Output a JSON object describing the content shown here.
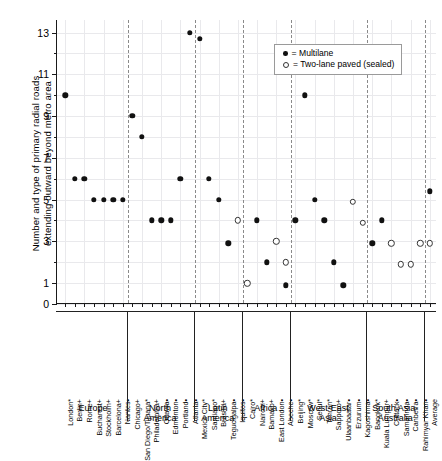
{
  "axis": {
    "ylabel": "Number and type of primary radial roads\nextending outward beyond metro area",
    "ytick_labels": [
      "13",
      "11",
      "9",
      "7",
      "5",
      "3",
      "1",
      "0"
    ],
    "ytick_values": [
      13,
      11,
      9,
      7,
      5,
      3,
      1,
      0
    ],
    "ylim": [
      0,
      13.6
    ]
  },
  "legend": {
    "entries": [
      {
        "marker": "filled-dot",
        "label": "= Multilane"
      },
      {
        "marker": "open-circle",
        "label": "= Two-lane paved (sealed)"
      }
    ]
  },
  "groups": [
    {
      "name": "Europe",
      "label": "Europe"
    },
    {
      "name": "North America",
      "label": "North\nAmerica"
    },
    {
      "name": "Latin America",
      "label": "Latin\nAmerica"
    },
    {
      "name": "Africa",
      "label": "Africa"
    },
    {
      "name": "West-East Asia",
      "label": "West-East\nAsia"
    },
    {
      "name": "South Asia-Australia",
      "label": "South Asia-\nAustralia"
    },
    {
      "name": "Average",
      "label": ""
    }
  ],
  "chart_data": {
    "type": "scatter",
    "title": "",
    "xlabel": "",
    "ylabel": "Number and type of primary radial roads extending outward beyond metro area",
    "ylim": [
      0,
      13.6
    ],
    "grid": true,
    "legend_position": "top-right",
    "categories": [
      "London*",
      "Berlin+",
      "Rome+",
      "Bucharest+",
      "Stockholm+",
      "Barcelona+",
      "Nantes•",
      "Chicago+",
      "San Diego/Tijuana*",
      "Philadelphia+",
      "Ottawa•",
      "Edmonton•",
      "Portland•",
      "Atlanta•",
      "Mexico City*",
      "Santiago*",
      "Brasilia+",
      "Tegucigalpa•",
      "Iquitos•",
      "Cairo*",
      "Nairobi+",
      "Bamako+",
      "East London•",
      "Abeche•",
      "Beijing*",
      "Moscow*",
      "Seoul*",
      "Tehran*",
      "Sapporo+",
      "Ulaanbaatar•",
      "Erzurum•",
      "Kagoshima•",
      "Bangkok*",
      "Kuala Lumpur+",
      "Cuttack•",
      "Samarinda•",
      "Canberra•",
      "Rahimyar Khan•",
      "Average"
    ],
    "series": [
      {
        "name": "Multilane",
        "marker": "filled-dot",
        "points": [
          {
            "city": "London*",
            "value": 10
          },
          {
            "city": "Berlin+",
            "value": 6
          },
          {
            "city": "Rome+",
            "value": 6
          },
          {
            "city": "Bucharest+",
            "value": 5
          },
          {
            "city": "Stockholm+",
            "value": 5
          },
          {
            "city": "Barcelona+",
            "value": 5
          },
          {
            "city": "Nantes•",
            "value": 5
          },
          {
            "city": "Chicago+",
            "value": 9
          },
          {
            "city": "San Diego/Tijuana*",
            "value": 8
          },
          {
            "city": "Philadelphia+",
            "value": 4
          },
          {
            "city": "Ottawa•",
            "value": 4
          },
          {
            "city": "Edmonton•",
            "value": 4
          },
          {
            "city": "Portland•",
            "value": 6
          },
          {
            "city": "Atlanta•",
            "value": 13
          },
          {
            "city": "Mexico City*",
            "value": 12.7
          },
          {
            "city": "Santiago*",
            "value": 6
          },
          {
            "city": "Brasilia+",
            "value": 5
          },
          {
            "city": "Tegucigalpa•",
            "value": 2.9
          },
          {
            "city": "Nairobi+",
            "value": 4
          },
          {
            "city": "Bamako+",
            "value": 2
          },
          {
            "city": "Abeche•",
            "value": 0.9
          },
          {
            "city": "Beijing*",
            "value": 4
          },
          {
            "city": "Moscow*",
            "value": 10
          },
          {
            "city": "Seoul*",
            "value": 5
          },
          {
            "city": "Tehran*",
            "value": 4
          },
          {
            "city": "Sapporo+",
            "value": 2
          },
          {
            "city": "Ulaanbaatar•",
            "value": 0.9
          },
          {
            "city": "Bangkok*",
            "value": 2.9
          },
          {
            "city": "Kuala Lumpur+",
            "value": 4
          },
          {
            "city": "Average",
            "value": 5.4
          }
        ]
      },
      {
        "name": "Two-lane paved (sealed)",
        "marker": "open-circle",
        "points": [
          {
            "city": "Iquitos•",
            "value": 4
          },
          {
            "city": "Cairo*",
            "value": 1
          },
          {
            "city": "East London•",
            "value": 3
          },
          {
            "city": "Abeche•",
            "value": 2
          },
          {
            "city": "Erzurum•",
            "value": 4.9
          },
          {
            "city": "Kagoshima•",
            "value": 3.9
          },
          {
            "city": "Cuttack•",
            "value": 2.9
          },
          {
            "city": "Samarinda•",
            "value": 1.9
          },
          {
            "city": "Canberra•",
            "value": 1.9
          },
          {
            "city": "Rahimyar Khan•",
            "value": 2.9
          },
          {
            "city": "Average",
            "value": 2.9
          }
        ]
      }
    ]
  }
}
